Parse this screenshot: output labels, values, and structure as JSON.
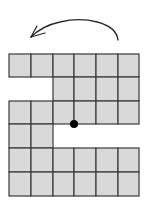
{
  "diagram": {
    "title": "",
    "grid": {
      "cols": 6,
      "rows": 6,
      "origin_x": 9,
      "origin_y": 54,
      "col_lines": [
        9,
        31,
        53,
        74,
        96,
        118,
        139
      ],
      "row_lines": [
        54,
        77,
        101,
        124,
        148,
        172,
        196
      ],
      "fill_color": "#d9d9d9",
      "stroke_color": "#3a3a3a",
      "shaded_cells": [
        [
          0,
          0
        ],
        [
          0,
          1
        ],
        [
          0,
          2
        ],
        [
          0,
          3
        ],
        [
          0,
          4
        ],
        [
          0,
          5
        ],
        [
          1,
          2
        ],
        [
          1,
          3
        ],
        [
          1,
          4
        ],
        [
          1,
          5
        ],
        [
          2,
          0
        ],
        [
          2,
          1
        ],
        [
          2,
          2
        ],
        [
          2,
          3
        ],
        [
          2,
          4
        ],
        [
          2,
          5
        ],
        [
          3,
          0
        ],
        [
          3,
          1
        ],
        [
          4,
          0
        ],
        [
          4,
          1
        ],
        [
          4,
          2
        ],
        [
          4,
          3
        ],
        [
          4,
          4
        ],
        [
          4,
          5
        ],
        [
          5,
          0
        ],
        [
          5,
          1
        ],
        [
          5,
          2
        ],
        [
          5,
          3
        ],
        [
          5,
          4
        ],
        [
          5,
          5
        ]
      ]
    },
    "pivot_point": {
      "x": 74,
      "y": 124,
      "radius": 4,
      "color": "#000000"
    },
    "rotation_arrow": {
      "direction": "counterclockwise",
      "color": "#2a2a2a"
    }
  }
}
